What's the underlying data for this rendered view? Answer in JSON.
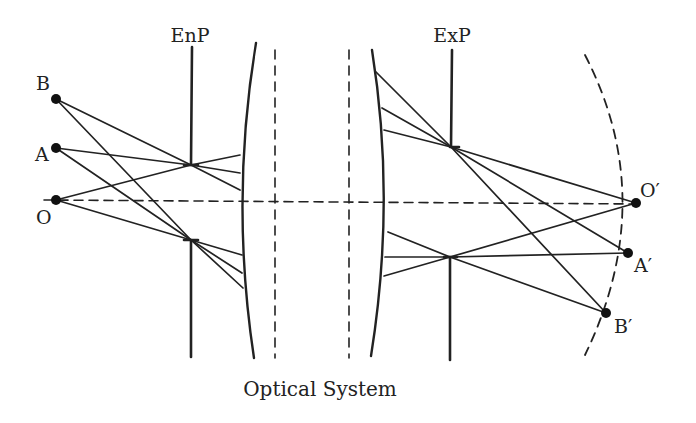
{
  "labels": {
    "enp": "EnP",
    "exp": "ExP",
    "b": "B",
    "a": "A",
    "o": "O",
    "o_prime": "O′",
    "a_prime": "A′",
    "b_prime": "B′",
    "caption": "Optical System"
  },
  "colors": {
    "stroke": "#222222",
    "background": "#ffffff"
  }
}
